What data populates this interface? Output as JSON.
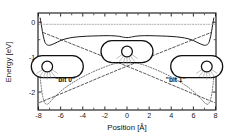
{
  "figure": {
    "kind": "potential-energy-diagram",
    "background_color": "#ffffff",
    "frame_color": "#111111"
  },
  "axes": {
    "x": {
      "label": "Position [Å]",
      "ticks": [
        "-8",
        "-6",
        "-4",
        "-2",
        "0",
        "2",
        "4",
        "6",
        "8"
      ],
      "tick_values": [
        -8,
        -6,
        -4,
        -2,
        0,
        2,
        4,
        6,
        8
      ],
      "range": [
        -8,
        8
      ],
      "minor_ticks": true
    },
    "y": {
      "label": "Energy [eV]",
      "ticks": [
        "0",
        "-1",
        "-2"
      ],
      "tick_values": [
        0,
        -1,
        -2
      ],
      "range": [
        -2.5,
        0.25
      ],
      "minor_ticks": true
    }
  },
  "annotations": [
    {
      "name": "bit-zero-label",
      "text": "\"bit 0\"",
      "x": -5.6,
      "y": -1.72
    },
    {
      "name": "bit-one-label",
      "text": "\"bit 1\"",
      "x": 4.4,
      "y": -1.72
    }
  ],
  "insets": [
    {
      "name": "inset-bit-zero",
      "center_x": -6.3,
      "center_y": -1.27,
      "atom_offset": -0.42,
      "atom_side": "left"
    },
    {
      "name": "inset-delocalized",
      "center_x": 0.0,
      "center_y": -0.84,
      "atom_offset": 0.0,
      "atom_side": "center"
    },
    {
      "name": "inset-bit-one",
      "center_x": 6.3,
      "center_y": -1.27,
      "atom_offset": 0.42,
      "atom_side": "right"
    }
  ],
  "chart_data": {
    "type": "line",
    "title": "",
    "xlabel": "Position [Å]",
    "ylabel": "Energy [eV]",
    "xlim": [
      -8,
      8
    ],
    "ylim": [
      -2.5,
      0.25
    ],
    "grid": false,
    "legend_position": "none",
    "series": [
      {
        "name": "upper adiabatic potential",
        "style": "solid",
        "color": "#1a1a1a",
        "x": [
          -7.85,
          -7.75,
          -7.65,
          -7.55,
          -7.45,
          -7.35,
          -7.2,
          -7.0,
          -6.7,
          -6.3,
          -5.8,
          -5.2,
          -4.5,
          -3.6,
          -2.6,
          -1.6,
          -0.8,
          -0.3,
          0.0,
          0.3,
          0.8,
          1.6,
          2.6,
          3.6,
          4.5,
          5.2,
          5.8,
          6.3,
          6.7,
          7.0,
          7.2,
          7.35,
          7.45,
          7.55,
          7.65,
          7.75,
          7.85
        ],
        "y": [
          0.12,
          -0.06,
          -0.26,
          -0.42,
          -0.54,
          -0.61,
          -0.65,
          -0.66,
          -0.63,
          -0.57,
          -0.5,
          -0.45,
          -0.42,
          -0.4,
          -0.39,
          -0.385,
          -0.4,
          -0.43,
          -0.44,
          -0.43,
          -0.4,
          -0.385,
          -0.39,
          -0.4,
          -0.42,
          -0.45,
          -0.5,
          -0.57,
          -0.63,
          -0.66,
          -0.65,
          -0.61,
          -0.54,
          -0.42,
          -0.26,
          -0.06,
          0.12
        ]
      },
      {
        "name": "lower adiabatic potential",
        "style": "dotted",
        "color": "#555555",
        "x": [
          -7.9,
          -7.8,
          -7.7,
          -7.6,
          -7.5,
          -7.4,
          -7.3,
          -7.15,
          -7.0,
          -6.8,
          -6.5,
          -6.1,
          -5.6,
          -5.0,
          -4.2,
          -3.2,
          -2.0,
          -1.0,
          0.0,
          1.0,
          2.0,
          3.2,
          4.2,
          5.0,
          5.6,
          6.1,
          6.5,
          6.8,
          7.0,
          7.15,
          7.3,
          7.4,
          7.5,
          7.6,
          7.7,
          7.8,
          7.9
        ],
        "y": [
          -1.42,
          -1.72,
          -1.98,
          -2.15,
          -2.26,
          -2.32,
          -2.35,
          -2.34,
          -2.3,
          -2.23,
          -2.13,
          -2.01,
          -1.88,
          -1.75,
          -1.6,
          -1.44,
          -1.28,
          -1.18,
          -1.14,
          -1.18,
          -1.28,
          -1.44,
          -1.6,
          -1.75,
          -1.88,
          -2.01,
          -2.13,
          -2.23,
          -2.3,
          -2.34,
          -2.35,
          -2.32,
          -2.26,
          -2.15,
          -1.98,
          -1.72,
          -1.42
        ]
      },
      {
        "name": "diabatic state bit 0",
        "style": "dashed",
        "color": "#333333",
        "x": [
          -7.9,
          -5.0,
          -2.0,
          0.0,
          2.0,
          5.0,
          7.55
        ],
        "y": [
          -2.3,
          -1.92,
          -1.52,
          -1.26,
          -1.0,
          -0.62,
          -0.3
        ]
      },
      {
        "name": "diabatic state bit 1",
        "style": "dashed",
        "color": "#333333",
        "x": [
          -7.55,
          -5.0,
          -2.0,
          0.0,
          2.0,
          5.0,
          7.9
        ],
        "y": [
          -0.3,
          -0.62,
          -1.0,
          -1.26,
          -1.52,
          -1.92,
          -2.3
        ]
      },
      {
        "name": "reference level",
        "style": "dotted",
        "color": "#999999",
        "x": [
          -8,
          8
        ],
        "y": [
          -0.06,
          -0.06
        ]
      }
    ]
  }
}
